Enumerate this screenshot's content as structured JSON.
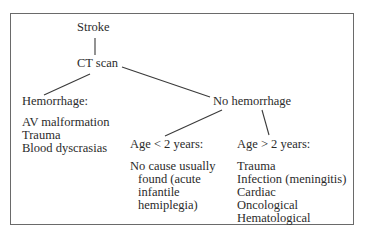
{
  "diagram": {
    "root": "Stroke",
    "step": "CT scan",
    "branches": {
      "hemorrhage": {
        "label": "Hemorrhage:",
        "causes": [
          "AV malformation",
          "Trauma",
          "Blood dyscrasias"
        ]
      },
      "no_hemorrhage": {
        "label": "No hemorrhage",
        "age_under_2": {
          "label": "Age < 2 years:",
          "causes": [
            "No cause usually",
            "found (acute",
            "infantile",
            "hemiplegia)"
          ]
        },
        "age_over_2": {
          "label": "Age > 2 years:",
          "causes": [
            "Trauma",
            "Infection (meningitis)",
            "Cardiac",
            "Oncological",
            "Hematological"
          ]
        }
      }
    },
    "line_color": "#3a3a3a",
    "border_color": "#6a6a6a"
  }
}
